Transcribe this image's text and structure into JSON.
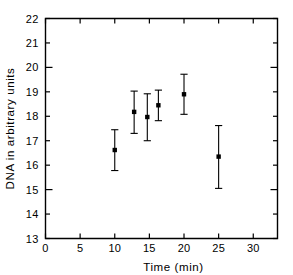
{
  "chart_data": {
    "type": "scatter",
    "title": "",
    "xlabel": "Time (min)",
    "ylabel": "DNA in arbitrary units",
    "xlim": [
      0,
      33.5
    ],
    "ylim": [
      13,
      22
    ],
    "grid": false,
    "legend": "none",
    "error_bars": "vertical, symmetric caps",
    "x_ticks": [
      0,
      5,
      10,
      15,
      20,
      25,
      30
    ],
    "x_tick_labels": [
      "0",
      "5",
      "10",
      "15",
      "20",
      "25",
      "30"
    ],
    "y_ticks": [
      13,
      14,
      15,
      16,
      17,
      18,
      19,
      20,
      21,
      22
    ],
    "y_tick_labels": [
      "13",
      "14",
      "15",
      "16",
      "17",
      "18",
      "19",
      "20",
      "21",
      "22"
    ],
    "series": [
      {
        "name": "DNA",
        "marker": "filled-square",
        "color": "#000000",
        "points": [
          {
            "x": 10.0,
            "y": 16.62,
            "y_low": 15.78,
            "y_high": 17.45
          },
          {
            "x": 12.8,
            "y": 18.18,
            "y_low": 17.3,
            "y_high": 19.03
          },
          {
            "x": 14.7,
            "y": 17.97,
            "y_low": 17.0,
            "y_high": 18.92
          },
          {
            "x": 16.3,
            "y": 18.45,
            "y_low": 17.82,
            "y_high": 19.07
          },
          {
            "x": 20.0,
            "y": 18.9,
            "y_low": 18.08,
            "y_high": 19.72
          },
          {
            "x": 25.0,
            "y": 16.35,
            "y_low": 15.05,
            "y_high": 17.62
          }
        ]
      }
    ]
  },
  "figure": {
    "background": "#ffffff",
    "ink_color": "#000000"
  }
}
